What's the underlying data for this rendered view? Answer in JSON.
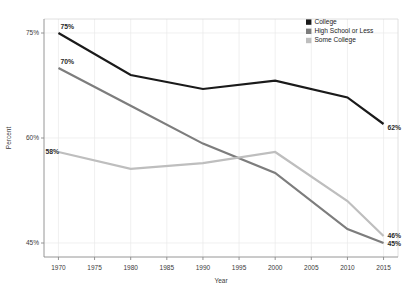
{
  "chart_data": {
    "type": "line",
    "title": "",
    "xlabel": "Year",
    "ylabel": "Percent",
    "x": [
      1970,
      1980,
      1990,
      2000,
      2010,
      2015
    ],
    "xlim": [
      1968,
      2017
    ],
    "ylim": [
      43,
      77
    ],
    "xticks": [
      1970,
      1975,
      1980,
      1985,
      1990,
      1995,
      2000,
      2005,
      2010,
      2015
    ],
    "xticklabels": [
      "1970",
      "1975",
      "1980",
      "1985",
      "1990",
      "1995",
      "2000",
      "2005",
      "2010",
      "2015"
    ],
    "yticks": [
      45,
      60,
      75
    ],
    "yticklabels": [
      "45%",
      "60%",
      "75%"
    ],
    "grid": true,
    "legend_position": "top-right",
    "series": [
      {
        "name": "College",
        "color": "#1a1a1a",
        "width": 2.2,
        "values": [
          75.0,
          69.0,
          67.0,
          68.2,
          65.8,
          62.0
        ],
        "labels": [
          {
            "x": 1970,
            "y": 75.0,
            "text": "75%",
            "dx": 2,
            "dy": -4
          },
          {
            "x": 2015,
            "y": 62.0,
            "text": "62%",
            "dx": 4,
            "dy": 6
          }
        ]
      },
      {
        "name": "High School or Less",
        "color": "#7d7d7d",
        "width": 2.2,
        "values": [
          70.0,
          64.6,
          59.2,
          55.0,
          47.0,
          45.0
        ],
        "labels": [
          {
            "x": 1970,
            "y": 70.0,
            "text": "70%",
            "dx": 2,
            "dy": -4
          },
          {
            "x": 2015,
            "y": 45.0,
            "text": "45%",
            "dx": 4,
            "dy": 3
          }
        ]
      },
      {
        "name": "Some College",
        "color": "#bebebe",
        "width": 2.2,
        "values": [
          58.0,
          55.6,
          56.4,
          58.0,
          51.0,
          46.0
        ],
        "labels": [
          {
            "x": 1970,
            "y": 58.0,
            "text": "58%",
            "dx": -13,
            "dy": 2
          },
          {
            "x": 2015,
            "y": 46.0,
            "text": "46%",
            "dx": 4,
            "dy": 2
          }
        ]
      }
    ],
    "legend": [
      {
        "label": "College",
        "color": "#1a1a1a"
      },
      {
        "label": "High School or Less",
        "color": "#7d7d7d"
      },
      {
        "label": "Some College",
        "color": "#bebebe"
      }
    ]
  }
}
